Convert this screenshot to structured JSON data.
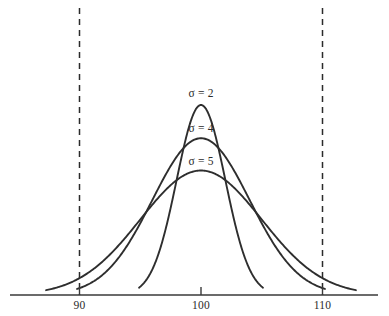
{
  "chart_data": {
    "type": "line",
    "title": "",
    "subtitle": "",
    "xlabel": "",
    "ylabel": "",
    "xlim": [
      84.5,
      114.5
    ],
    "ylim": [
      0,
      1.05
    ],
    "grid": false,
    "legend_position": "inline-above-peak",
    "x_ticks": [
      {
        "value": 90,
        "label": "90"
      },
      {
        "value": 100,
        "label": "100"
      },
      {
        "value": 110,
        "label": "110"
      }
    ],
    "y_ticks": [],
    "mean": 100,
    "series": [
      {
        "name": "sigma-2",
        "label": "σ = 2",
        "sigma": 2,
        "mean": 100,
        "peak_height": 1.0,
        "color": "#2e2e2e",
        "label_x": 100,
        "label_y": 1.04
      },
      {
        "name": "sigma-4",
        "label": "σ = 4",
        "sigma": 4,
        "mean": 100,
        "peak_height": 0.825,
        "color": "#2e2e2e",
        "label_x": 100,
        "label_y": 0.86
      },
      {
        "name": "sigma-5",
        "label": "σ = 5",
        "sigma": 5,
        "mean": 100,
        "peak_height": 0.655,
        "color": "#2e2e2e",
        "label_x": 100,
        "label_y": 0.685
      }
    ],
    "reference_lines": [
      {
        "name": "lower-spec-limit",
        "value": 90,
        "style": "dashed",
        "color": "#2b2b2b"
      },
      {
        "name": "upper-spec-limit",
        "value": 110,
        "style": "dashed",
        "color": "#2b2b2b"
      }
    ],
    "annotations": []
  },
  "labels": {
    "sigma_2": "σ = 2",
    "sigma_4": "σ = 4",
    "sigma_5": "σ = 5",
    "tick_90": "90",
    "tick_100": "100",
    "tick_110": "110"
  }
}
